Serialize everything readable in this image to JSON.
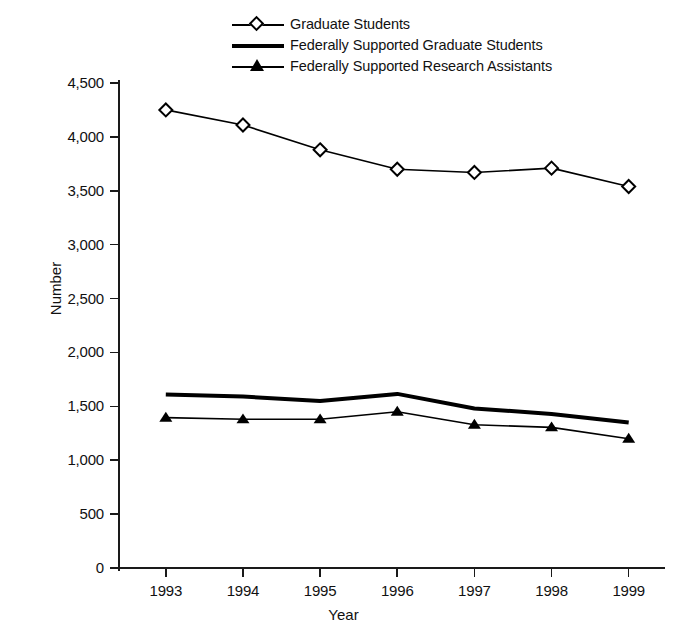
{
  "chart_data": {
    "type": "line",
    "title": "",
    "xlabel": "Year",
    "ylabel": "Number",
    "categories": [
      "1993",
      "1994",
      "1995",
      "1996",
      "1997",
      "1998",
      "1999"
    ],
    "x": [
      1993,
      1994,
      1995,
      1996,
      1997,
      1998,
      1999
    ],
    "ylim": [
      0,
      4500
    ],
    "ytick_values": [
      0,
      500,
      1000,
      1500,
      2000,
      2500,
      3000,
      3500,
      4000,
      4500
    ],
    "ytick_labels": [
      "0",
      "500",
      "1,000",
      "1,500",
      "2,000",
      "2,500",
      "3,000",
      "3,500",
      "4,000",
      "4,500"
    ],
    "grid": false,
    "legend_position": "top-center",
    "series": [
      {
        "name": "Graduate Students",
        "marker": "open-diamond",
        "line": "thin",
        "color": "#000000",
        "values": [
          4250,
          4110,
          3880,
          3700,
          3670,
          3710,
          3540
        ]
      },
      {
        "name": "Federally Supported Graduate Students",
        "marker": "none",
        "line": "thick",
        "color": "#000000",
        "values": [
          1610,
          1590,
          1550,
          1615,
          1480,
          1430,
          1350
        ]
      },
      {
        "name": "Federally Supported Research Assistants",
        "marker": "filled-triangle",
        "line": "thin",
        "color": "#000000",
        "values": [
          1395,
          1380,
          1380,
          1450,
          1330,
          1305,
          1200
        ]
      }
    ]
  },
  "legend": {
    "items": [
      {
        "label": "Graduate Students",
        "key": "diamond-line-key"
      },
      {
        "label": "Federally Supported Graduate Students",
        "key": "thick-line-key"
      },
      {
        "label": "Federally Supported Research Assistants",
        "key": "triangle-line-key"
      }
    ]
  },
  "axes": {
    "x_title": "Year",
    "y_title": "Number"
  }
}
